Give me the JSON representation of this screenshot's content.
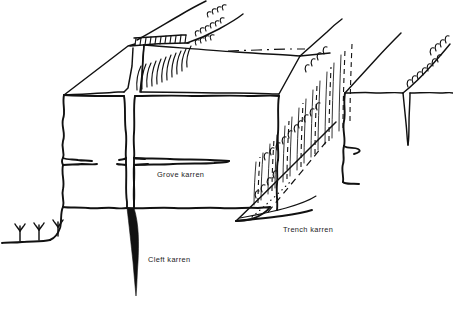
{
  "figure": {
    "kind": "line-drawing",
    "width": 453,
    "height": 309,
    "background_color": "#ffffff",
    "ink_color": "#111111",
    "text_color": "#1b1b1b"
  },
  "labels": [
    {
      "id": "grove",
      "text": "Grove karren",
      "x": 157,
      "y": 177
    },
    {
      "id": "trench",
      "text": "Trench karren",
      "x": 283,
      "y": 232
    },
    {
      "id": "cleft",
      "text": "Cleft karren",
      "x": 148,
      "y": 262
    }
  ],
  "features": {
    "grove_karren": "horizontal tapering slot in the limestone block face",
    "cleft_karren": "narrow deep vertical fissure splitting the block",
    "trench_karren": "wide sloping grooved trench on the right of the block",
    "vegetation": "three grass tufts on the ground surface at lower left",
    "hatching": "comb-like tick hatching along ridge crests and cleft edges",
    "dashed_lines": "dash-dot horizon and dashed grooves on the far trench wall"
  }
}
